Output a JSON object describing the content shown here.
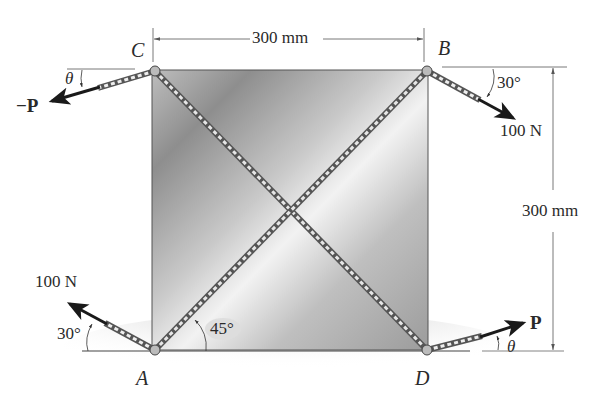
{
  "figure": {
    "type": "statics free-body diagram",
    "plate": {
      "shape": "square",
      "width_label": "300 mm",
      "height_label": "300 mm"
    },
    "points": {
      "A": "A",
      "B": "B",
      "C": "C",
      "D": "D"
    },
    "dimensions": {
      "top": "300 mm",
      "right": "300 mm"
    },
    "forces": {
      "at_B": {
        "magnitude": "100 N",
        "angle": "30°",
        "direction": "down-right"
      },
      "at_A": {
        "magnitude": "100 N",
        "angle": "30°",
        "direction": "up-left"
      },
      "at_C": {
        "label": "−P",
        "angle": "θ",
        "direction": "down-left"
      },
      "at_D": {
        "label": "P",
        "angle": "θ",
        "direction": "up-right"
      }
    },
    "angles": {
      "diagonal_at_A": "45°"
    },
    "colors": {
      "plate_light": "#e6e6e6",
      "plate_dark": "#9a9a9a",
      "arrow": "#1a1a1a",
      "rope": "#8c8c8c",
      "dim_line": "#555555"
    }
  }
}
